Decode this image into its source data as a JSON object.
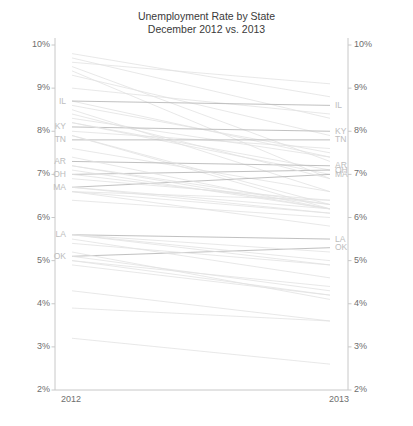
{
  "chart_data": {
    "type": "line",
    "title_line1": "Unemployment Rate by State",
    "title_line2": "December 2012 vs. 2013",
    "xlabel": "",
    "ylabel": "",
    "categories": [
      "2012",
      "2013"
    ],
    "x_tick_labels": [
      "2012",
      "2013"
    ],
    "ylim": [
      2,
      10
    ],
    "y_tick_values": [
      2,
      3,
      4,
      5,
      6,
      7,
      8,
      9,
      10
    ],
    "y_tick_labels": [
      "2%",
      "3%",
      "4%",
      "5%",
      "6%",
      "7%",
      "8%",
      "9%",
      "10%"
    ],
    "grid": false,
    "legend_position": "none",
    "left_axis_labels": [
      "10%",
      "9%",
      "8%",
      "7%",
      "6%",
      "5%",
      "4%",
      "3%",
      "2%"
    ],
    "right_axis_labels": [
      "10%",
      "9%",
      "8%",
      "7%",
      "6%",
      "5%",
      "4%",
      "3%",
      "2%"
    ],
    "labeled_states_left": [
      "IL",
      "KY",
      "TN",
      "AR",
      "OH",
      "MA",
      "LA",
      "OK"
    ],
    "labeled_states_right": [
      "IL",
      "KY",
      "TN",
      "AR",
      "OH",
      "MA",
      "LA",
      "OK"
    ],
    "line_color_default": "#e2e2e2",
    "line_color_highlight": "#b9b9b9",
    "axis_color": "#c8c8c8",
    "label_color": "#bdbdbd",
    "tick_color": "#6e6e6e",
    "title_color": "#3a3a3a",
    "series": [
      {
        "name": "NV",
        "label": "",
        "highlight": false,
        "values": [
          9.8,
          8.8
        ]
      },
      {
        "name": "RI",
        "label": "",
        "highlight": false,
        "values": [
          9.6,
          9.1
        ]
      },
      {
        "name": "MI",
        "label": "",
        "highlight": false,
        "values": [
          9.0,
          8.4
        ]
      },
      {
        "name": "CA",
        "label": "",
        "highlight": false,
        "values": [
          9.7,
          8.3
        ]
      },
      {
        "name": "NJ",
        "label": "",
        "highlight": false,
        "values": [
          9.5,
          7.3
        ]
      },
      {
        "name": "MS",
        "label": "",
        "highlight": false,
        "values": [
          9.3,
          7.9
        ]
      },
      {
        "name": "DC",
        "label": "",
        "highlight": false,
        "values": [
          8.6,
          7.5
        ]
      },
      {
        "name": "NC",
        "label": "",
        "highlight": false,
        "values": [
          9.4,
          6.9
        ]
      },
      {
        "name": "GA",
        "label": "",
        "highlight": false,
        "values": [
          8.7,
          7.4
        ]
      },
      {
        "name": "IL",
        "label": "IL",
        "highlight": true,
        "values": [
          8.7,
          8.6
        ]
      },
      {
        "name": "AZ",
        "label": "",
        "highlight": false,
        "values": [
          8.0,
          7.6
        ]
      },
      {
        "name": "SC",
        "label": "",
        "highlight": false,
        "values": [
          8.5,
          6.6
        ]
      },
      {
        "name": "CT",
        "label": "",
        "highlight": false,
        "values": [
          8.3,
          7.4
        ]
      },
      {
        "name": "KY",
        "label": "KY",
        "highlight": true,
        "values": [
          8.1,
          8.0
        ]
      },
      {
        "name": "OR",
        "label": "",
        "highlight": false,
        "values": [
          8.2,
          7.0
        ]
      },
      {
        "name": "TN",
        "label": "TN",
        "highlight": true,
        "values": [
          7.8,
          7.8
        ]
      },
      {
        "name": "NY",
        "label": "",
        "highlight": false,
        "values": [
          8.2,
          7.1
        ]
      },
      {
        "name": "WA",
        "label": "",
        "highlight": false,
        "values": [
          7.6,
          6.6
        ]
      },
      {
        "name": "FL",
        "label": "",
        "highlight": false,
        "values": [
          7.9,
          6.2
        ]
      },
      {
        "name": "AR",
        "label": "AR",
        "highlight": true,
        "values": [
          7.3,
          7.2
        ]
      },
      {
        "name": "OH",
        "label": "OH",
        "highlight": true,
        "values": [
          7.0,
          7.1
        ]
      },
      {
        "name": "MA",
        "label": "MA",
        "highlight": true,
        "values": [
          6.7,
          7.0
        ]
      },
      {
        "name": "AL",
        "label": "",
        "highlight": false,
        "values": [
          7.2,
          6.2
        ]
      },
      {
        "name": "PA",
        "label": "",
        "highlight": false,
        "values": [
          7.9,
          6.3
        ]
      },
      {
        "name": "IN",
        "label": "",
        "highlight": false,
        "values": [
          8.4,
          6.9
        ]
      },
      {
        "name": "MO",
        "label": "",
        "highlight": false,
        "values": [
          6.7,
          6.1
        ]
      },
      {
        "name": "ME",
        "label": "",
        "highlight": false,
        "values": [
          7.0,
          6.3
        ]
      },
      {
        "name": "WV",
        "label": "",
        "highlight": false,
        "values": [
          7.1,
          6.2
        ]
      },
      {
        "name": "NM",
        "label": "",
        "highlight": false,
        "values": [
          6.9,
          6.4
        ]
      },
      {
        "name": "CO",
        "label": "",
        "highlight": false,
        "values": [
          7.4,
          6.2
        ]
      },
      {
        "name": "DE",
        "label": "",
        "highlight": false,
        "values": [
          7.2,
          6.3
        ]
      },
      {
        "name": "TX",
        "label": "",
        "highlight": false,
        "values": [
          6.4,
          6.0
        ]
      },
      {
        "name": "ID",
        "label": "",
        "highlight": false,
        "values": [
          6.6,
          5.8
        ]
      },
      {
        "name": "WI",
        "label": "",
        "highlight": false,
        "values": [
          6.7,
          6.2
        ]
      },
      {
        "name": "MD",
        "label": "",
        "highlight": false,
        "values": [
          6.6,
          6.1
        ]
      },
      {
        "name": "LA",
        "label": "LA",
        "highlight": true,
        "values": [
          5.6,
          5.5
        ]
      },
      {
        "name": "OK",
        "label": "OK",
        "highlight": true,
        "values": [
          5.1,
          5.3
        ]
      },
      {
        "name": "VA",
        "label": "",
        "highlight": false,
        "values": [
          5.6,
          5.2
        ]
      },
      {
        "name": "MN",
        "label": "",
        "highlight": false,
        "values": [
          5.5,
          4.6
        ]
      },
      {
        "name": "KS",
        "label": "",
        "highlight": false,
        "values": [
          5.4,
          4.9
        ]
      },
      {
        "name": "AK",
        "label": "",
        "highlight": false,
        "values": [
          6.6,
          6.4
        ]
      },
      {
        "name": "MT",
        "label": "",
        "highlight": false,
        "values": [
          5.6,
          5.0
        ]
      },
      {
        "name": "NH",
        "label": "",
        "highlight": false,
        "values": [
          5.6,
          4.9
        ]
      },
      {
        "name": "IA",
        "label": "",
        "highlight": false,
        "values": [
          4.9,
          4.2
        ]
      },
      {
        "name": "UT",
        "label": "",
        "highlight": false,
        "values": [
          5.2,
          4.1
        ]
      },
      {
        "name": "HI",
        "label": "",
        "highlight": false,
        "values": [
          5.0,
          4.4
        ]
      },
      {
        "name": "WY",
        "label": "",
        "highlight": false,
        "values": [
          5.1,
          4.3
        ]
      },
      {
        "name": "VT",
        "label": "",
        "highlight": false,
        "values": [
          5.0,
          4.2
        ]
      },
      {
        "name": "NE",
        "label": "",
        "highlight": false,
        "values": [
          3.9,
          3.6
        ]
      },
      {
        "name": "SD",
        "label": "",
        "highlight": false,
        "values": [
          4.3,
          3.6
        ]
      },
      {
        "name": "ND",
        "label": "",
        "highlight": false,
        "values": [
          3.2,
          2.6
        ]
      }
    ]
  }
}
